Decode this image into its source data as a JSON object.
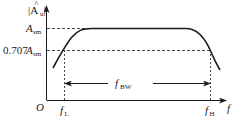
{
  "diagram": {
    "y_axis": {
      "label_main": "|A",
      "label_hat": "^",
      "label_sub": "u",
      "label_close": "|"
    },
    "x_axis": {
      "label": "f"
    },
    "origin": {
      "label": "O"
    },
    "levels": [
      {
        "name": "A_sm",
        "main": "A",
        "sub": "sm",
        "prefix": ""
      },
      {
        "name": "0.707A_sm",
        "main": "A",
        "sub": "sm",
        "prefix": "0.707"
      }
    ],
    "freq_marks": [
      {
        "name": "f_L",
        "main": "f",
        "sub": "L"
      },
      {
        "name": "f_H",
        "main": "f",
        "sub": "H"
      }
    ],
    "bandwidth": {
      "main": "f",
      "sub": "BW"
    },
    "colors": {
      "line": "#1a1a1a",
      "background": "#ffffff"
    }
  }
}
